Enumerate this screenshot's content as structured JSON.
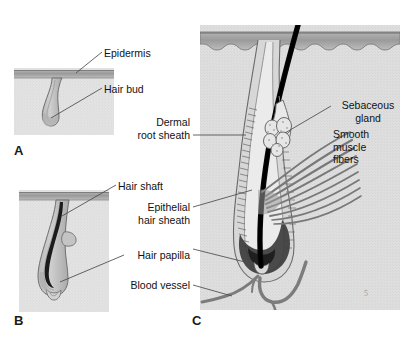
{
  "figure": {
    "background_color": "#ffffff",
    "panel_letters": [
      {
        "id": "A",
        "text": "A",
        "x": 14,
        "y": 143
      },
      {
        "id": "B",
        "text": "B",
        "x": 14,
        "y": 313
      },
      {
        "id": "C",
        "text": "C",
        "x": 192,
        "y": 313
      }
    ],
    "corner_mark": "5"
  },
  "panels": {
    "a": {
      "letter": "A",
      "stage_name": "Hair bud",
      "box": {
        "x": 14,
        "y": 68,
        "w": 100,
        "h": 67
      }
    },
    "b": {
      "letter": "B",
      "stage_name": "Hair peg / bulbous peg",
      "box": {
        "x": 19,
        "y": 190,
        "w": 90,
        "h": 122
      }
    },
    "c": {
      "letter": "C",
      "stage_name": "Mature hair follicle",
      "box": {
        "x": 200,
        "y": 25,
        "w": 200,
        "h": 285
      }
    }
  },
  "labels": {
    "epidermis": {
      "text": "Epidermis",
      "align": "left",
      "x": 104,
      "y": 53
    },
    "hair_bud": {
      "text": "Hair bud",
      "align": "left",
      "x": 104,
      "y": 89
    },
    "dermal_root_sheath": {
      "line1": "Dermal",
      "line2": "root sheath",
      "align": "right",
      "x": 132,
      "y": 118
    },
    "sebaceous_gland": {
      "line1": "Sebaceous",
      "line2": "gland",
      "align": "left",
      "x": 334,
      "y": 104
    },
    "smooth_muscle_fibers": {
      "line1": "Smooth",
      "line2": "muscle",
      "line3": "fibers",
      "align": "left",
      "x": 334,
      "y": 134
    },
    "hair_shaft": {
      "text": "Hair shaft",
      "align": "left",
      "x": 118,
      "y": 186
    },
    "epithelial_hair_sheath": {
      "line1": "Epithelial",
      "line2": "hair sheath",
      "align": "right",
      "x": 190,
      "y": 213
    },
    "hair_papilla": {
      "text": "Hair papilla",
      "align": "right",
      "x": 190,
      "y": 256
    },
    "blood_vessel": {
      "text": "Blood vessel",
      "align": "right",
      "x": 190,
      "y": 287
    }
  },
  "colors": {
    "epidermis": "#a6a6a6",
    "epidermis_dark": "#8d8d8d",
    "dermis": "#e3e3e3",
    "dermis_c": "#dcdcdc",
    "follicle_fill": "#c9c9c9",
    "follicle_stroke": "#6f6f6f",
    "hair_shaft": "#0d0d0d",
    "sheath_dark": "#5a5a5a",
    "muscle": "#7d7d7d",
    "vessel": "#7a7a7a",
    "leader_line": "#4a4a4a",
    "text": "#121212",
    "corner_mark": "#9a9a9a"
  }
}
